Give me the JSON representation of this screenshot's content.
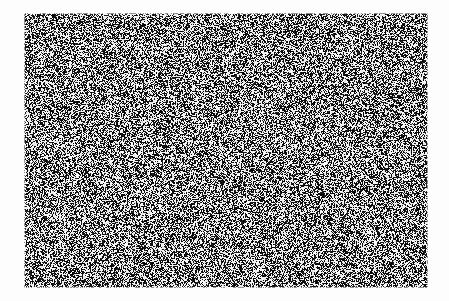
{
  "image": {
    "kind": "random-dot-noise-field",
    "description": "Full-bleed black-and-white random dot noise rectangle centered on a white page",
    "canvas": {
      "width": 449,
      "height": 301,
      "background_color": "#fdfdfd"
    },
    "noise_field": {
      "x": 24,
      "y": 13,
      "width": 404,
      "height": 275,
      "dot_size_px": 1,
      "fill_ratio": 0.5,
      "dark_color": "#101010",
      "light_color": "#f2f2f2",
      "seed": 20240513,
      "has_border": false,
      "uniform_density": true
    },
    "margins": {
      "left": 24,
      "right": 21,
      "top": 13,
      "bottom": 13
    },
    "text_content": [],
    "embedded_shapes": []
  }
}
